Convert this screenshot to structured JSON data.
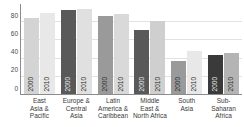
{
  "chart_data": {
    "type": "bar",
    "title": "",
    "xlabel": "",
    "ylabel": "",
    "ylim": [
      0,
      100
    ],
    "yticks": [
      0,
      20,
      40,
      60,
      80
    ],
    "grid": true,
    "legend_position": "none",
    "categories": [
      "East Asia & Pacific",
      "Europe & Central Asia",
      "Latin America & Caribbean",
      "Middle East & North Africa",
      "South Asia",
      "Sub-Saharan Africa"
    ],
    "category_lines": [
      [
        "East",
        "Asia &",
        "Pacific"
      ],
      [
        "Europe &",
        "Central",
        "Asia"
      ],
      [
        "Latin",
        "America &",
        "Caribbean"
      ],
      [
        "Middle",
        "East &",
        "North Africa"
      ],
      [
        "South",
        "Asia"
      ],
      [
        "Sub-",
        "Saharan",
        "Africa"
      ]
    ],
    "series": [
      {
        "name": "2000",
        "values": [
          85,
          93,
          87,
          71,
          37,
          43
        ]
      },
      {
        "name": "2010",
        "values": [
          90,
          95,
          89,
          81,
          48,
          46
        ]
      }
    ],
    "bar_colors": [
      [
        "#d4d4d4",
        "#e8e8e8"
      ],
      [
        "#595959",
        "#e0e0e0"
      ],
      [
        "#9a9a9a",
        "#d9d9d9"
      ],
      [
        "#595959",
        "#cfcfcf"
      ],
      [
        "#9a9a9a",
        "#e8e8e8"
      ],
      [
        "#3a3a3a",
        "#b4b4b4"
      ]
    ],
    "bar_labels": [
      [
        "2000",
        "2010"
      ],
      [
        "2000",
        "2010"
      ],
      [
        "2000",
        "2010"
      ],
      [
        "2000",
        "2010"
      ],
      [
        "2000",
        "2010"
      ],
      [
        "2000",
        "2010"
      ]
    ],
    "axis_color": "#8c8c8c",
    "grid_color": "#e2e2e2"
  }
}
